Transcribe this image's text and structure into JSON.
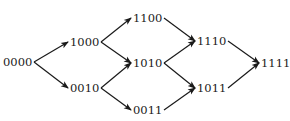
{
  "diagram": {
    "type": "lattice",
    "nodes": [
      {
        "id": "0000",
        "label": "0000",
        "x": 3,
        "y": 62
      },
      {
        "id": "1000",
        "label": "1000",
        "x": 70,
        "y": 42
      },
      {
        "id": "0010",
        "label": "0010",
        "x": 70,
        "y": 88
      },
      {
        "id": "1100",
        "label": "1100",
        "x": 133,
        "y": 18
      },
      {
        "id": "1010",
        "label": "1010",
        "x": 133,
        "y": 63
      },
      {
        "id": "0011",
        "label": "0011",
        "x": 133,
        "y": 110
      },
      {
        "id": "1110",
        "label": "1110",
        "x": 197,
        "y": 41
      },
      {
        "id": "1011",
        "label": "1011",
        "x": 197,
        "y": 88
      },
      {
        "id": "1111",
        "label": "1111",
        "x": 261,
        "y": 63
      }
    ],
    "edges": [
      {
        "from": "0000",
        "to": "1000"
      },
      {
        "from": "0000",
        "to": "0010"
      },
      {
        "from": "1000",
        "to": "1100"
      },
      {
        "from": "1000",
        "to": "1010"
      },
      {
        "from": "0010",
        "to": "1010"
      },
      {
        "from": "0010",
        "to": "0011"
      },
      {
        "from": "1100",
        "to": "1110"
      },
      {
        "from": "1010",
        "to": "1110"
      },
      {
        "from": "1010",
        "to": "1011"
      },
      {
        "from": "0011",
        "to": "1011"
      },
      {
        "from": "1110",
        "to": "1111"
      },
      {
        "from": "1011",
        "to": "1111"
      }
    ],
    "colors": {
      "line": "#1a1a1a",
      "text": "#1a1a1a",
      "background": "#ffffff"
    }
  }
}
